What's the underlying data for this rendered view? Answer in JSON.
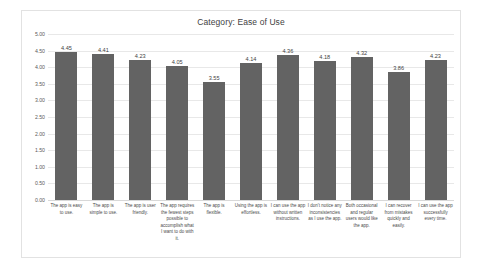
{
  "chart_data": {
    "type": "bar",
    "title": "Category: Ease of Use",
    "xlabel": "",
    "ylabel": "",
    "ylim": [
      0.0,
      5.0
    ],
    "ytick_labels": [
      "5.00",
      "4.50",
      "4.00",
      "3.50",
      "3.00",
      "2.50",
      "2.00",
      "1.50",
      "1.00",
      "0.50",
      "0.00"
    ],
    "ytick_values": [
      5.0,
      4.5,
      4.0,
      3.5,
      3.0,
      2.5,
      2.0,
      1.5,
      1.0,
      0.5,
      0.0
    ],
    "grid": true,
    "legend": "none",
    "bar_color": "#636363",
    "categories": [
      "The app is easy to use.",
      "The app is simple to use.",
      "The app is user friendly.",
      "The app requires the fewest steps possible to accomplish what I want to do with it.",
      "The app is flexible.",
      "Using the app is effortless.",
      "I can use the app without written instructions.",
      "I don't notice any inconsistencies as I use the app.",
      "Both occasional and regular users would like the app.",
      "I can recover from mistakes quickly and easily.",
      "I can use the app successfully every time."
    ],
    "values": [
      4.45,
      4.41,
      4.23,
      4.05,
      3.55,
      4.14,
      4.36,
      4.18,
      4.32,
      3.86,
      4.23
    ],
    "value_labels": [
      "4.45",
      "4.41",
      "4.23",
      "4.05",
      "3.55",
      "4.14",
      "4.36",
      "4.18",
      "4.32",
      "3.86",
      "4.23"
    ]
  }
}
